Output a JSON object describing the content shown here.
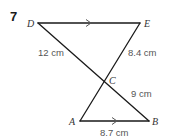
{
  "question": {
    "number": "7"
  },
  "points": {
    "D": {
      "label": "D",
      "x": 38,
      "y": 23
    },
    "E": {
      "label": "E",
      "x": 140,
      "y": 23
    },
    "C": {
      "label": "C",
      "x": 104,
      "y": 80
    },
    "A": {
      "label": "A",
      "x": 80,
      "y": 121
    },
    "B": {
      "label": "B",
      "x": 149,
      "y": 121
    }
  },
  "segments": [
    {
      "from": "D",
      "to": "E",
      "parallel_marker": true
    },
    {
      "from": "A",
      "to": "B",
      "parallel_marker": true
    },
    {
      "from": "D",
      "to": "B"
    },
    {
      "from": "E",
      "to": "A"
    }
  ],
  "measurements": {
    "DC": "12 cm",
    "EC": "8.4 cm",
    "CB": "9 cm",
    "AB": "8.7 cm"
  },
  "colors": {
    "line": "#1a1a1a",
    "label": "#555555",
    "background": "#ffffff"
  }
}
